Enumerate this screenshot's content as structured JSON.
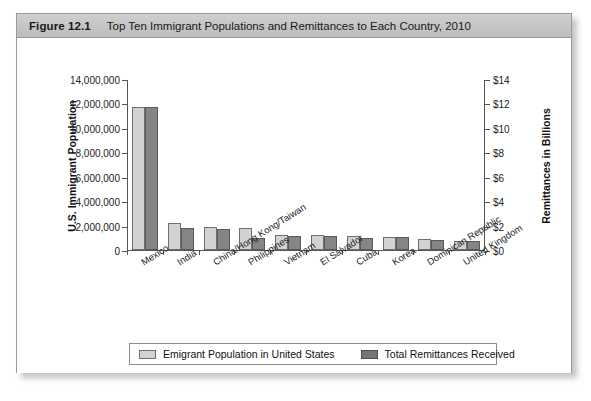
{
  "figure": {
    "number_label": "Figure 12.1",
    "title": "Top Ten Immigrant Populations and Remittances to Each Country, 2010"
  },
  "chart_data": {
    "type": "bar",
    "title": "Top Ten Immigrant Populations and Remittances to Each Country, 2010",
    "xlabel": "",
    "ylabel": "U.S. Immigrant Population",
    "y2label": "Remittances in Billions",
    "ylim": [
      0,
      14000000
    ],
    "y2lim": [
      0,
      14
    ],
    "ytick_labels": [
      "14,000,000",
      "12,000,000",
      "10,000,000",
      "8,000,000",
      "6,000,000",
      "4,000,000",
      "2,000,000",
      "0"
    ],
    "ytick_values": [
      14000000,
      12000000,
      10000000,
      8000000,
      6000000,
      4000000,
      2000000,
      0
    ],
    "y2tick_labels": [
      "$14",
      "$12",
      "$10",
      "$8",
      "$6",
      "$4",
      "$2",
      "$0"
    ],
    "y2tick_values": [
      14,
      12,
      10,
      8,
      6,
      4,
      2,
      0
    ],
    "grid": false,
    "legend_position": "bottom",
    "categories": [
      "Mexico",
      "India",
      "China/Hong Kong/Taiwan",
      "Philippines",
      "Vietnam",
      "El Salvador",
      "Cuba",
      "Korea",
      "Dominican Republic",
      "United Kingdom"
    ],
    "series": [
      {
        "name": "Emigrant Population in United States",
        "axis": "left",
        "color": "#d2d2d2",
        "values": [
          11700000,
          2200000,
          1900000,
          1800000,
          1250000,
          1200000,
          1150000,
          1100000,
          900000,
          700000
        ]
      },
      {
        "name": "Total Remittances Received",
        "axis": "right",
        "color": "#858585",
        "values": [
          11.7,
          1.8,
          1.7,
          0.95,
          1.15,
          1.15,
          1.0,
          1.05,
          0.8,
          0.7
        ]
      }
    ]
  },
  "legend": {
    "entries": [
      {
        "label": "Emigrant Population in United States",
        "color": "#d2d2d2"
      },
      {
        "label": "Total Remittances Received",
        "color": "#757575"
      }
    ]
  }
}
